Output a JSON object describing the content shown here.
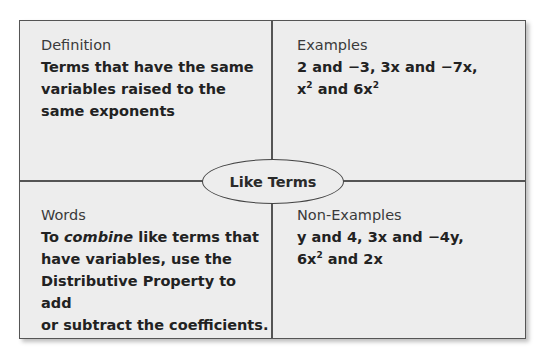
{
  "center_label": "Like Terms",
  "quadrants": {
    "top_left": {
      "title": "Definition",
      "lines": [
        "Terms that have the same",
        "variables raised to the",
        "same exponents"
      ]
    },
    "top_right": {
      "title": "Examples",
      "line1": "2 and −3, 3x and −7x,",
      "line2_a": "x",
      "line2_sup1": "2",
      "line2_b": " and 6x",
      "line2_sup2": "2"
    },
    "bottom_left": {
      "title": "Words",
      "line1_a": "To ",
      "line1_em": "combine",
      "line1_b": " like terms that",
      "lines": [
        "have variables, use the",
        "Distributive Property to add",
        "or subtract the coefficients."
      ]
    },
    "bottom_right": {
      "title": "Non-Examples",
      "line1": "y and 4, 3x and −4y,",
      "line2_a": "6x",
      "line2_sup": "2",
      "line2_b": " and 2x"
    }
  },
  "colors": {
    "background": "#ededed",
    "border": "#555555",
    "text": "#222222"
  }
}
